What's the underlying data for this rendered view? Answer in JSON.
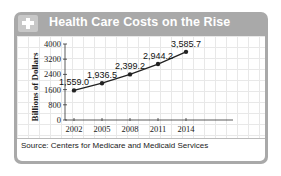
{
  "header": {
    "title": "Health Care Costs on the Rise",
    "icon": "plus-icon"
  },
  "source": "Source: Centers for Medicare and Medicaid Services",
  "colors": {
    "frame": "#a9a9a9",
    "line": "#222222",
    "grid": "#e8e8e8"
  },
  "chart_data": {
    "type": "line",
    "title": "Health Care Costs on the Rise",
    "xlabel": "",
    "ylabel": "Billions of Dollars",
    "categories": [
      "2002",
      "2005",
      "2008",
      "2011",
      "2014"
    ],
    "x": [
      2002,
      2005,
      2008,
      2011,
      2014
    ],
    "values": [
      1559.0,
      1936.5,
      2399.2,
      2944.2,
      3585.7
    ],
    "data_labels": [
      "1,559.0",
      "1,936.5",
      "2,399.2",
      "2,944.2",
      "3,585.7"
    ],
    "yticks": [
      "0",
      "800",
      "1600",
      "2400",
      "3200",
      "4000"
    ],
    "ylim": [
      0,
      4000
    ],
    "grid": true,
    "legend": null,
    "source": "Source: Centers for Medicare and Medicaid Services"
  }
}
